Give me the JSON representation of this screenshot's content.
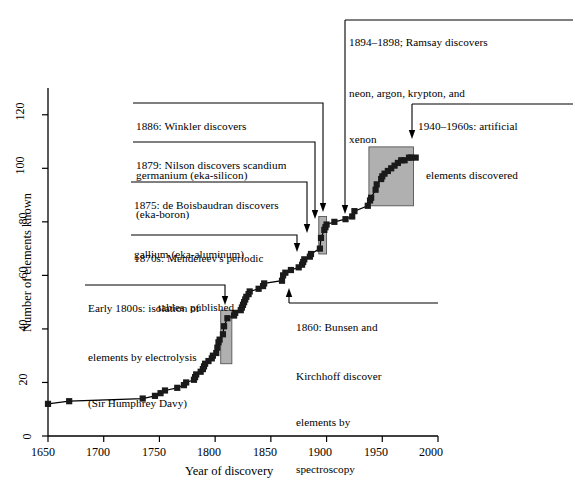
{
  "chart_data": {
    "type": "line",
    "title": "",
    "xlabel": "Year of discovery",
    "ylabel": "Number of elements known",
    "xlim": [
      1650,
      2000
    ],
    "ylim": [
      0,
      130
    ],
    "xticks": [
      1650,
      1700,
      1750,
      1800,
      1850,
      1900,
      1950,
      2000
    ],
    "xtick_labels": [
      "1650",
      "1700",
      "1750",
      "1800",
      "1850",
      "1900",
      "1950",
      "2000"
    ],
    "yticks": [
      0,
      20,
      40,
      60,
      80,
      100,
      120
    ],
    "ytick_labels": [
      "0",
      "20",
      "40",
      "60",
      "80",
      "100",
      "120"
    ],
    "grid": false,
    "legend": "none",
    "marker": "filled-square",
    "series": [
      {
        "name": "Cumulative elements known",
        "x": [
          1650,
          1669,
          1735,
          1746,
          1751,
          1755,
          1766,
          1772,
          1774,
          1781,
          1782,
          1783,
          1787,
          1789,
          1790,
          1791,
          1794,
          1797,
          1798,
          1801,
          1802,
          1803,
          1804,
          1807,
          1808,
          1811,
          1817,
          1818,
          1823,
          1824,
          1825,
          1826,
          1827,
          1828,
          1830,
          1831,
          1839,
          1843,
          1844,
          1860,
          1861,
          1863,
          1868,
          1875,
          1878,
          1879,
          1880,
          1885,
          1886,
          1894,
          1895,
          1898,
          1899,
          1900,
          1907,
          1917,
          1923,
          1925,
          1937,
          1939,
          1940,
          1944,
          1945,
          1949,
          1950,
          1952,
          1955,
          1958,
          1961,
          1964,
          1967,
          1970,
          1974,
          1976,
          1980
        ],
        "y": [
          12,
          13,
          14,
          15,
          16,
          17,
          18,
          19,
          20,
          21,
          22,
          23,
          24,
          25,
          26,
          27,
          28,
          29,
          30,
          31,
          33,
          35,
          36,
          38,
          41,
          44,
          45,
          46,
          47,
          48,
          49,
          50,
          51,
          52,
          53,
          54,
          55,
          56,
          57,
          58,
          60,
          61,
          62,
          63,
          64,
          65,
          66,
          67,
          68,
          70,
          74,
          77,
          78,
          79,
          80,
          81,
          82,
          84,
          86,
          88,
          89,
          92,
          94,
          96,
          97,
          98,
          99,
          100,
          101,
          102,
          103,
          103,
          104,
          104,
          104
        ]
      }
    ],
    "highlight_boxes": [
      {
        "name": "electrolysis-era",
        "x0": 1805,
        "x1": 1815,
        "y0": 27,
        "y1": 47
      },
      {
        "name": "noble-gases-era",
        "x0": 1893,
        "x1": 1900,
        "y0": 68,
        "y1": 82
      },
      {
        "name": "artificial-elements-era",
        "x0": 1938,
        "x1": 1978,
        "y0": 86,
        "y1": 108
      }
    ],
    "annotations": [
      {
        "id": "ramsay",
        "lines": [
          "1894–1898; Ramsay discovers",
          "neon, argon, krypton, and",
          "xenon"
        ],
        "target_x": 1896,
        "target_y": 70
      },
      {
        "id": "artificial",
        "lines": [
          "1940–1960s: artificial",
          "elements discovered"
        ],
        "target_x": 1958,
        "target_y": 108
      },
      {
        "id": "winkler",
        "lines": [
          "1886: Winkler discovers",
          "germanium (eka-silicon)"
        ],
        "target_x": 1886,
        "target_y": 68
      },
      {
        "id": "nilson",
        "lines": [
          "1879: Nilson discovers scandium",
          "(eka-boron)"
        ],
        "target_x": 1879,
        "target_y": 65
      },
      {
        "id": "boisbaudran",
        "lines": [
          "1875: de Boisbaudran discovers",
          "gallium (eka-aluminum)"
        ],
        "target_x": 1875,
        "target_y": 63
      },
      {
        "id": "mendeleev",
        "lines": [
          "1870s: Mendeleev's periodic",
          "tables  published"
        ],
        "target_x": 1871,
        "target_y": 62
      },
      {
        "id": "davy",
        "lines": [
          "Early 1800s: isolation of",
          "elements by electrolysis",
          "(Sir Humphrey Davy)"
        ],
        "target_x": 1810,
        "target_y": 47
      },
      {
        "id": "bunsen",
        "lines": [
          "1860: Bunsen and",
          "Kirchhoff discover",
          "elements by",
          "spectroscopy"
        ],
        "target_x": 1862,
        "target_y": 58
      }
    ]
  },
  "axis": {
    "x_title": "Year of discovery",
    "y_title": "Number of elements known"
  },
  "colors": {
    "line": "#000000",
    "marker": "#1a1a1a",
    "highlight_fill": "#b0b0b0",
    "axis": "#000000",
    "background": "#ffffff"
  },
  "annotation_text": {
    "ramsay": {
      "l1": "1894–1898; Ramsay discovers",
      "l2": "neon, argon, krypton, and",
      "l3": "xenon"
    },
    "artificial": {
      "l1": "1940–1960s: artificial",
      "l2": "elements discovered"
    },
    "winkler": {
      "l1": "1886: Winkler discovers",
      "l2": "germanium (eka-silicon)"
    },
    "nilson": {
      "l1": "1879: Nilson discovers scandium",
      "l2": "(eka-boron)"
    },
    "boisbaudran": {
      "l1": "1875: de Boisbaudran discovers",
      "l2": "gallium (eka-aluminum)"
    },
    "mendeleev": {
      "l1": "1870s: Mendeleev's periodic",
      "l2": "tables  published"
    },
    "davy": {
      "l1": "Early 1800s: isolation of",
      "l2": "elements by electrolysis",
      "l3": "(Sir Humphrey Davy)"
    },
    "bunsen": {
      "l1": "1860: Bunsen and",
      "l2": "Kirchhoff discover",
      "l3": "elements by",
      "l4": "spectroscopy"
    }
  },
  "ticks": {
    "x": [
      "1650",
      "1700",
      "1750",
      "1800",
      "1850",
      "1900",
      "1950",
      "2000"
    ],
    "y": [
      "0",
      "20",
      "40",
      "60",
      "80",
      "100",
      "120"
    ]
  }
}
